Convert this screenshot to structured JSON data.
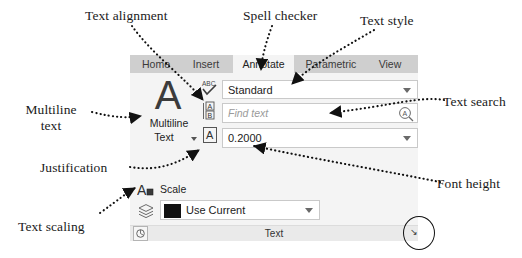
{
  "callouts": [
    {
      "id": "text-alignment",
      "label": "Text alignment"
    },
    {
      "id": "spell-checker",
      "label": "Spell checker"
    },
    {
      "id": "text-style",
      "label": "Text style"
    },
    {
      "id": "multiline-text",
      "label": "Multiline text"
    },
    {
      "id": "text-search",
      "label": "Text search"
    },
    {
      "id": "justification",
      "label": "Justification"
    },
    {
      "id": "font-height",
      "label": "Font height"
    },
    {
      "id": "text-scaling",
      "label": "Text scaling"
    }
  ],
  "callout_text": {
    "text_alignment": "Text alignment",
    "spell_checker": "Spell checker",
    "text_style": "Text style",
    "multiline_text_l1": "Multiline",
    "multiline_text_l2": "text",
    "text_search": "Text search",
    "justification": "Justification",
    "font_height": "Font height",
    "text_scaling": "Text scaling"
  },
  "ribbon": {
    "tabs": [
      {
        "label": "Home",
        "active": false
      },
      {
        "label": "Insert",
        "active": false
      },
      {
        "label": "Annotate",
        "active": true
      },
      {
        "label": "Parametric",
        "active": false
      },
      {
        "label": "View",
        "active": false
      }
    ],
    "panel": {
      "name": "Text",
      "multiline_button": {
        "glyph": "A",
        "label_line1": "Multiline",
        "label_line2": "Text",
        "dropdown": "chevron-down-icon"
      },
      "icons": [
        {
          "name": "spell-check-icon",
          "caption": "ABC"
        },
        {
          "name": "text-alignment-icon",
          "caption": "A B"
        },
        {
          "name": "justification-icon",
          "caption": "A"
        }
      ],
      "style_combo": {
        "value": "Standard",
        "caret": "chevron-down-icon"
      },
      "find_field": {
        "placeholder": "Find text",
        "icon": "text-search-icon"
      },
      "height_combo": {
        "value": "0.2000",
        "caret": "chevron-down-icon"
      },
      "scale_row": {
        "label": "Scale",
        "icon": "text-scale-icon"
      },
      "layer_row": {
        "value": "Use Current",
        "icon": "layers-icon",
        "swatch_color": "#111111",
        "caret": "chevron-down-icon"
      },
      "footer_icon": "annotation-scale-icon",
      "dialog_launcher": "dialog-launcher-icon"
    }
  },
  "colors": {
    "tabbar_bg": "#cfcfcf",
    "panel_bg": "#f4f4f4",
    "footer_bg": "#eaeaea",
    "field_border": "#c9c9c9",
    "swatch": "#111111",
    "text": "#222222",
    "placeholder": "#9a9a9a"
  }
}
